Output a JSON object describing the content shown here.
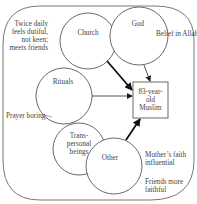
{
  "diagram": {
    "central": {
      "label_lines": [
        "83-year-",
        "old",
        "Muslim"
      ]
    },
    "nodes": [
      {
        "id": "church",
        "label": "Church"
      },
      {
        "id": "god",
        "label": "God"
      },
      {
        "id": "rituals",
        "label": "Rituals"
      },
      {
        "id": "transpersonal",
        "label_lines": [
          "Trans-",
          "personal",
          "beings"
        ]
      },
      {
        "id": "other",
        "label": "Other"
      }
    ],
    "annotations": {
      "church_note_lines": [
        "Twice daily",
        "feels dutiful,",
        "not keen;",
        "meets friends"
      ],
      "god_note": "Belief in Allah",
      "rituals_note": "Prayer boring",
      "other_note_1_lines": [
        "Mother’s faith",
        "influential"
      ],
      "other_note_2_lines": [
        "Friends more",
        "faithful"
      ]
    },
    "edges": [
      {
        "from": "church",
        "to": "central",
        "weight": "strong"
      },
      {
        "from": "god",
        "to": "central",
        "weight": "weak"
      },
      {
        "from": "rituals",
        "to": "central",
        "weight": "weak"
      },
      {
        "from": "other",
        "to": "central",
        "weight": "strong"
      }
    ]
  }
}
